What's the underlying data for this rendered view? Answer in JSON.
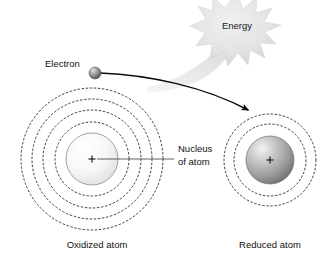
{
  "figure": {
    "background_color": "#ffffff"
  },
  "labels": {
    "electron": "Electron",
    "energy": "Energy",
    "nucleus_line1": "Nucleus",
    "nucleus_line2": "of atom",
    "oxidized_caption": "Oxidized atom",
    "reduced_caption": "Reduced atom"
  },
  "atoms": {
    "oxidized": {
      "name": "Oxidized atom",
      "center_x": 92,
      "center_y": 159,
      "nucleus_radius": 26,
      "nucleus_sign": "+",
      "orbit_count": 4,
      "orbit_radii": [
        37,
        50,
        60,
        71
      ],
      "nucleus_fill_light": "#fdfdfd",
      "nucleus_fill_dark": "#dcdcdc"
    },
    "reduced": {
      "name": "Reduced atom",
      "center_x": 270,
      "center_y": 160,
      "nucleus_radius": 24,
      "nucleus_sign": "+",
      "orbit_count": 2,
      "orbit_radii": [
        36,
        46
      ],
      "nucleus_fill_light": "#f2f2f2",
      "nucleus_fill_dark": "#6f6f6f"
    }
  },
  "electron": {
    "label": "Electron",
    "x": 95,
    "y": 73,
    "radius": 6,
    "fill_light": "#d7d7d7",
    "fill_dark": "#4a4a4a"
  },
  "arrow": {
    "name": "electron-transfer-arrow",
    "start_x": 99,
    "start_y": 73,
    "end_x": 251,
    "end_y": 112,
    "color": "#0d0d0d"
  },
  "energy_burst": {
    "label": "Energy",
    "center_x": 237,
    "center_y": 25,
    "outer_radius": 33,
    "inner_radius": 20,
    "points": 13,
    "fill": "#e2e2e2",
    "cone_fill": "#e8e8e8"
  },
  "nucleus_callout": {
    "text_line1": "Nucleus",
    "text_line2": "of atom",
    "text_x": 178,
    "text_y1": 149,
    "text_y2": 162,
    "leader_start_x": 97,
    "leader_start_y": 159,
    "leader_end_x": 174,
    "leader_end_y": 159
  },
  "colors": {
    "stroke_dark": "#2b2b2b",
    "text": "#111111",
    "burst": "#e2e2e2",
    "background": "#ffffff"
  }
}
